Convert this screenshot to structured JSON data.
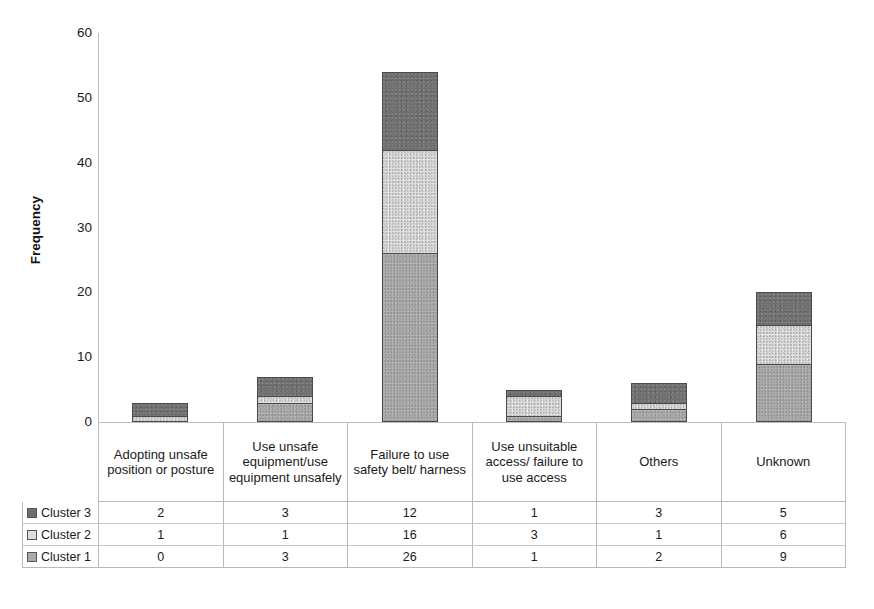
{
  "chart_data": {
    "type": "bar",
    "subtype": "stacked-bar-with-data-table",
    "title": "",
    "xlabel": "",
    "ylabel": "Frequency",
    "ylim": [
      0,
      60
    ],
    "yticks": [
      60,
      50,
      40,
      30,
      20,
      10,
      0
    ],
    "grid": false,
    "legend_position": "data-table-left",
    "stack_order_bottom_to_top": [
      "Cluster 1",
      "Cluster 2",
      "Cluster 3"
    ],
    "categories": [
      "Adopting unsafe position or posture",
      "Use unsafe equipment/use equipment unsafely",
      "Failure to use safety belt/ harness",
      "Use unsuitable access/ failure to use access",
      "Others",
      "Unknown"
    ],
    "series": [
      {
        "name": "Cluster 3",
        "color": "#6e6e6e",
        "values": [
          2,
          3,
          12,
          1,
          3,
          5
        ]
      },
      {
        "name": "Cluster 2",
        "color": "#dedede",
        "values": [
          1,
          1,
          16,
          3,
          1,
          6
        ]
      },
      {
        "name": "Cluster 1",
        "color": "#a9a9a9",
        "values": [
          0,
          3,
          26,
          1,
          2,
          9
        ]
      }
    ],
    "totals": [
      3,
      7,
      54,
      5,
      6,
      20
    ]
  },
  "axis": {
    "y_title": "Frequency",
    "y_tick_labels": [
      "60",
      "50",
      "40",
      "30",
      "20",
      "10",
      "0"
    ]
  },
  "category_band": {
    "cells": [
      "Adopting unsafe position or posture",
      "Use unsafe equipment/use equipment unsafely",
      "Failure to use safety belt/ harness",
      "Use unsuitable access/ failure to use access",
      "Others",
      "Unknown"
    ]
  },
  "data_table": {
    "rows": [
      {
        "label": "Cluster 3",
        "swatch_color": "#6e6e6e",
        "values": [
          "2",
          "3",
          "12",
          "1",
          "3",
          "5"
        ]
      },
      {
        "label": "Cluster 2",
        "swatch_color": "#dedede",
        "values": [
          "1",
          "1",
          "16",
          "3",
          "1",
          "6"
        ]
      },
      {
        "label": "Cluster 1",
        "swatch_color": "#a9a9a9",
        "values": [
          "0",
          "3",
          "26",
          "1",
          "2",
          "9"
        ]
      }
    ]
  }
}
